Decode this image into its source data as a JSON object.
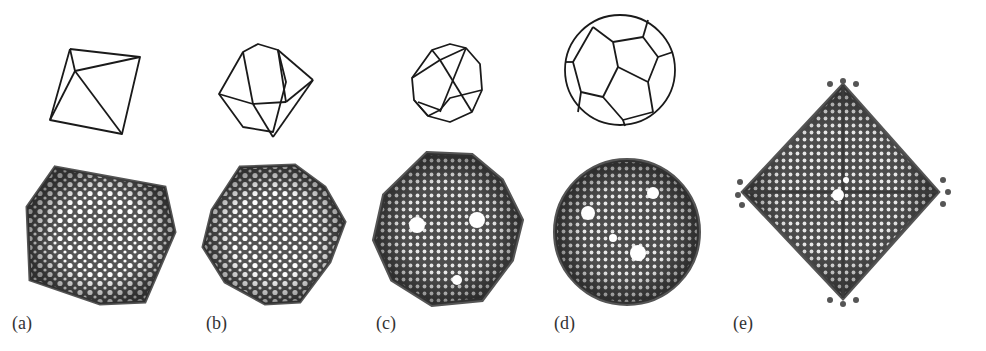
{
  "figure": {
    "panels": [
      {
        "id": "a",
        "label": "(a)",
        "polyhedron": "octahedron",
        "cage_shape": "octahedral cage (rotated)"
      },
      {
        "id": "b",
        "label": "(b)",
        "polyhedron": "cuboctahedron",
        "cage_shape": "cuboctahedral cage"
      },
      {
        "id": "c",
        "label": "(c)",
        "polyhedron": "icosidodecahedron",
        "cage_shape": "icosahedral-like cage with holes"
      },
      {
        "id": "d",
        "label": "(d)",
        "polyhedron": "rhombicosidodecahedron",
        "cage_shape": "near-spherical cage with holes"
      },
      {
        "id": "e",
        "label": "(e)",
        "polyhedron": "none",
        "cage_shape": "octahedral cage with protruding vertices"
      }
    ],
    "colors": {
      "background": "#ffffff",
      "wireframe": "#1a1a1a",
      "cage_dark": "#4a4a4a",
      "cage_light": "#8a8a8a",
      "label": "#333333"
    }
  }
}
